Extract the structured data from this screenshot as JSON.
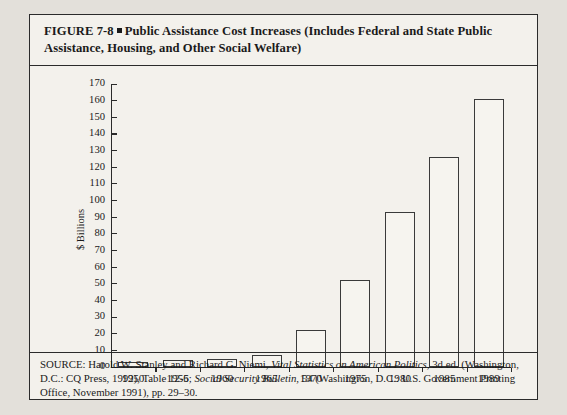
{
  "figure": {
    "label": "FIGURE 7-8",
    "bullet": "■",
    "title": "Public Assistance Cost Increases (Includes Federal and State Public Assistance, Housing, and Other Social Welfare)"
  },
  "source": {
    "prefix": "SOURCE: Harold W. Stanley and Richard G. Niemi,",
    "work1": "Vital Statistics on American Politics,",
    "mid1": "3d ed. (Washington, D.C.: CQ Press, 1992), Table 12-6;",
    "work2": "Social Security Bulletin,",
    "mid2": "54 (Washington, D.C.: U.S. Government Printing Office, November 1991), pp. 29–30."
  },
  "colors": {
    "page_background": "#e3e0da",
    "panel_background": "#f3f1ec",
    "ink": "#2b2b2b",
    "bar_fill": "#f6f4ef",
    "bar_stroke": "#3a3a3a"
  },
  "chart_data": {
    "type": "bar",
    "title": "Public Assistance Cost Increases (Includes Federal and State Public Assistance, Housing, and Other Social Welfare)",
    "xlabel": "",
    "ylabel": "$ Billions",
    "categories": [
      "1950",
      "1955",
      "1960",
      "1965",
      "1970",
      "1975",
      "1980",
      "1985",
      "1989"
    ],
    "values": [
      3,
      4,
      5,
      7,
      22,
      52,
      93,
      126,
      161
    ],
    "ylim": [
      0,
      170
    ],
    "ytick_step": 10,
    "yticks": [
      0,
      10,
      20,
      30,
      40,
      50,
      60,
      70,
      80,
      90,
      100,
      110,
      120,
      130,
      140,
      150,
      160,
      170
    ],
    "ytick_labels": [
      "0",
      "10",
      "20",
      "30",
      "40",
      "50",
      "60",
      "70",
      "80",
      "90",
      "100",
      "110",
      "120",
      "130",
      "140",
      "150",
      "160",
      "170"
    ],
    "grid": false,
    "legend": null,
    "series": [
      {
        "name": "Public assistance cost",
        "values": [
          3,
          4,
          5,
          7,
          22,
          52,
          93,
          126,
          161
        ]
      }
    ]
  }
}
